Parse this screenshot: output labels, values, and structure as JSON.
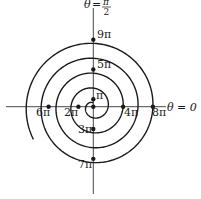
{
  "figure": {
    "type": "polar-spiral",
    "equation_hint": "r = a*theta (Archimedean spiral)",
    "axis_labels": {
      "vertical": {
        "theta": "θ",
        "eq": "=",
        "num": "π",
        "den": "2"
      },
      "horizontal": {
        "text": "θ = 0"
      }
    },
    "points": [
      {
        "label": "π",
        "multiple": 1
      },
      {
        "label": "2π",
        "multiple": 2
      },
      {
        "label": "3π",
        "multiple": 3
      },
      {
        "label": "4π",
        "multiple": 4
      },
      {
        "label": "5π",
        "multiple": 5
      },
      {
        "label": "6π",
        "multiple": 6
      },
      {
        "label": "7π",
        "multiple": 7
      },
      {
        "label": "8π",
        "multiple": 8
      },
      {
        "label": "9π",
        "multiple": 9
      }
    ],
    "colors": {
      "stroke": "#1a1a1a",
      "background": "#ffffff"
    }
  }
}
